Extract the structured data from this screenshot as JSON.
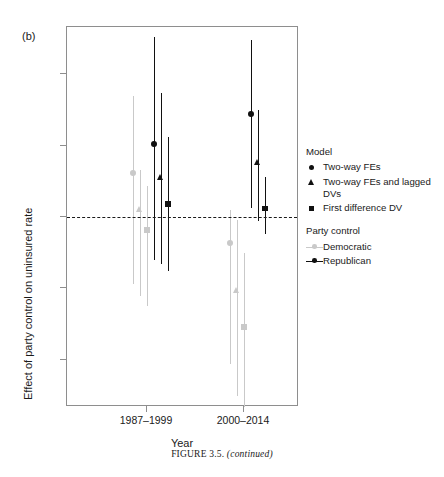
{
  "panel": {
    "label": "(b)"
  },
  "caption": {
    "figure": "FIGURE 3.5.",
    "continued": "(continued)"
  },
  "axes": {
    "ylabel": "Effect of party control on uninsured rate",
    "xlabel": "Year",
    "yticks": [
      "1.0",
      "0.5",
      "0.0",
      "-0.5",
      "-1.0"
    ],
    "ytick_values": [
      1.0,
      0.5,
      0.0,
      -0.5,
      -1.0
    ],
    "xticks": [
      "1987–1999",
      "2000–2014"
    ],
    "ylim": [
      -1.33,
      1.33
    ],
    "zero_reference": 0.0
  },
  "legend": {
    "model_title": "Model",
    "model_items": [
      {
        "marker": "circle",
        "label": "Two-way FEs"
      },
      {
        "marker": "triangle",
        "label": "Two-way FEs and lagged DVs"
      },
      {
        "marker": "square",
        "label": "First difference DV"
      }
    ],
    "party_title": "Party control",
    "party_items": [
      {
        "key": "democratic",
        "label": "Democratic",
        "color": "#c9c9c9"
      },
      {
        "key": "republican",
        "label": "Republican",
        "color": "#111111"
      }
    ]
  },
  "chart_data": {
    "type": "scatter",
    "title": "",
    "subtitle": "",
    "xlabel": "Year",
    "ylabel": "Effect of party control on uninsured rate",
    "ylim": [
      -1.33,
      1.33
    ],
    "xtick_labels": [
      "1987–1999",
      "2000–2014"
    ],
    "grid": false,
    "legend_position": "right",
    "reference_lines": [
      {
        "y": 0.0,
        "style": "dashed"
      }
    ],
    "colors": {
      "democratic": "#c9c9c9",
      "republican": "#111111"
    },
    "series": [
      {
        "name": "Democratic – Two-way FEs",
        "party": "Democratic",
        "model": "Two-way FEs",
        "marker": "circle",
        "color": "#c9c9c9",
        "points": [
          {
            "group": "1987–1999",
            "estimate": 0.31,
            "ci_low": -0.47,
            "ci_high": 0.85
          },
          {
            "group": "2000–2014",
            "estimate": -0.18,
            "ci_low": -1.03,
            "ci_high": 0.05
          }
        ]
      },
      {
        "name": "Democratic – Two-way FEs and lagged DVs",
        "party": "Democratic",
        "model": "Two-way FEs and lagged DVs",
        "marker": "triangle",
        "color": "#c9c9c9",
        "points": [
          {
            "group": "1987–1999",
            "estimate": 0.05,
            "ci_low": -0.55,
            "ci_high": 0.33
          },
          {
            "group": "2000–2014",
            "estimate": -0.52,
            "ci_low": -1.25,
            "ci_high": -0.02
          }
        ]
      },
      {
        "name": "Democratic – First difference DV",
        "party": "Democratic",
        "model": "First difference DV",
        "marker": "square",
        "color": "#c9c9c9",
        "points": [
          {
            "group": "1987–1999",
            "estimate": -0.09,
            "ci_low": -0.62,
            "ci_high": 0.22
          },
          {
            "group": "2000–2014",
            "estimate": -0.77,
            "ci_low": -1.33,
            "ci_high": -0.25
          }
        ]
      },
      {
        "name": "Republican – Two-way FEs",
        "party": "Republican",
        "model": "Two-way FEs",
        "marker": "circle",
        "color": "#111111",
        "points": [
          {
            "group": "1987–1999",
            "estimate": 0.51,
            "ci_low": -0.3,
            "ci_high": 1.26
          },
          {
            "group": "2000–2014",
            "estimate": 0.72,
            "ci_low": 0.06,
            "ci_high": 1.24
          }
        ]
      },
      {
        "name": "Republican – Two-way FEs and lagged DVs",
        "party": "Republican",
        "model": "Two-way FEs and lagged DVs",
        "marker": "triangle",
        "color": "#111111",
        "points": [
          {
            "group": "1987–1999",
            "estimate": 0.27,
            "ci_low": -0.33,
            "ci_high": 0.87
          },
          {
            "group": "2000–2014",
            "estimate": 0.38,
            "ci_low": -0.03,
            "ci_high": 0.75
          }
        ]
      },
      {
        "name": "Republican – First difference DV",
        "party": "Republican",
        "model": "First difference DV",
        "marker": "square",
        "color": "#111111",
        "points": [
          {
            "group": "1987–1999",
            "estimate": 0.09,
            "ci_low": -0.38,
            "ci_high": 0.56
          },
          {
            "group": "2000–2014",
            "estimate": 0.06,
            "ci_low": -0.12,
            "ci_high": 0.28
          }
        ]
      }
    ]
  }
}
